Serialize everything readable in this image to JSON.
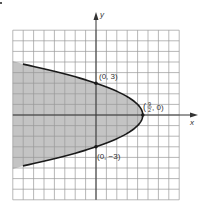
{
  "chart_data": {
    "type": "area",
    "title": "",
    "equation": "x = 9/2 - y^2/2",
    "xlabel": "x",
    "ylabel": "y",
    "xlim": [
      -8,
      8
    ],
    "ylim": [
      -8,
      8
    ],
    "grid": true,
    "grid_step": 1,
    "shading": "region to the left of the parabola (x <= 9/2 - y^2/2)",
    "points": [
      {
        "x": 0,
        "y": 3,
        "label": "(0, 3)"
      },
      {
        "x": 4.5,
        "y": 0,
        "label_num": "9",
        "label_den": "2",
        "label_rest": ", 0)",
        "label_open": "("
      },
      {
        "x": 0,
        "y": -3,
        "label": "(0, −3)"
      }
    ],
    "curve_y_range": [
      -4.8,
      4.8
    ],
    "legend": []
  },
  "colors": {
    "shade": "#c4c4c4",
    "grid": "#9a9a9a",
    "axis": "#333333",
    "curve": "#1a1a1a"
  }
}
